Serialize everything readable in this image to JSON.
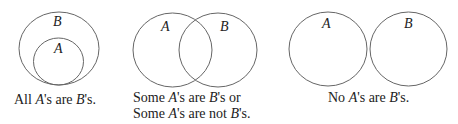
{
  "diagrams": [
    {
      "id": "all",
      "labels": {
        "outer": "B",
        "inner": "A"
      },
      "caption": {
        "p1": "All ",
        "a": "A",
        "p2": "'s are ",
        "b": "B",
        "p3": "'s."
      }
    },
    {
      "id": "some",
      "labels": {
        "left": "A",
        "right": "B"
      },
      "caption_line1": {
        "p1": "Some ",
        "a": "A",
        "p2": "'s are ",
        "b": "B",
        "p3": "'s or"
      },
      "caption_line2": {
        "p1": "Some ",
        "a": "A",
        "p2": "'s are not ",
        "b": "B",
        "p3": "'s."
      }
    },
    {
      "id": "none",
      "labels": {
        "left": "A",
        "right": "B"
      },
      "caption": {
        "p1": "No ",
        "a": "A",
        "p2": "'s are ",
        "b": "B",
        "p3": "'s."
      }
    }
  ],
  "colors": {
    "stroke": "#555555",
    "text": "#222222"
  }
}
